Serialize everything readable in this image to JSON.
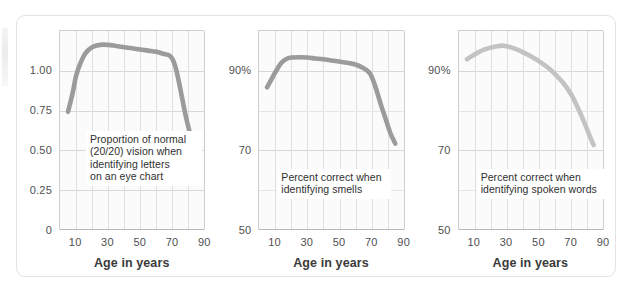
{
  "figure": {
    "axis_title": "Age in years",
    "curve_color_dark": "#9b9b9b",
    "curve_color_light": "#c3c3c3",
    "grid_color": "#e0e0e0",
    "panel_bg": "#fbfbfb",
    "card_border": "#e3e3e3"
  },
  "chart_data": [
    {
      "type": "line",
      "title": "",
      "annotation": "Proportion of normal\n(20/20) vision when\nidentifying letters\non an eye chart",
      "xlabel": "Age in years",
      "ylabel": "",
      "xlim": [
        0,
        90
      ],
      "ylim": [
        0,
        1.25
      ],
      "xticks": [
        10,
        30,
        50,
        70,
        90
      ],
      "xtick_labels": [
        "10",
        "30",
        "50",
        "70",
        "90"
      ],
      "yticks": [
        0,
        0.25,
        0.5,
        0.75,
        1.0
      ],
      "ytick_labels": [
        "0",
        "0.25",
        "0.50",
        "0.75",
        "1.00"
      ],
      "grid": true,
      "legend": "none",
      "series": [
        {
          "name": "Proportion of normal (20/20) vision",
          "color": "#9b9b9b",
          "x": [
            5,
            8,
            10,
            13,
            16,
            20,
            25,
            30,
            35,
            40,
            45,
            50,
            55,
            60,
            65,
            68,
            70,
            72,
            74,
            76,
            78,
            80,
            83,
            85
          ],
          "values": [
            0.55,
            0.72,
            0.86,
            0.98,
            1.06,
            1.11,
            1.13,
            1.13,
            1.12,
            1.11,
            1.1,
            1.09,
            1.08,
            1.07,
            1.05,
            1.04,
            1.01,
            0.94,
            0.82,
            0.68,
            0.54,
            0.42,
            0.25,
            0.14
          ]
        }
      ]
    },
    {
      "type": "line",
      "title": "",
      "annotation": "Percent correct when\nidentifying smells",
      "xlabel": "Age in years",
      "ylabel": "",
      "xlim": [
        0,
        90
      ],
      "ylim": [
        50,
        100
      ],
      "xticks": [
        10,
        30,
        50,
        70,
        90
      ],
      "xtick_labels": [
        "10",
        "30",
        "50",
        "70",
        "90"
      ],
      "yticks": [
        50,
        70,
        90
      ],
      "ytick_labels": [
        "50",
        "70",
        "90%"
      ],
      "grid": true,
      "legend": "none",
      "series": [
        {
          "name": "Percent correct identifying smells",
          "color": "#9b9b9b",
          "x": [
            5,
            8,
            11,
            14,
            17,
            20,
            25,
            30,
            35,
            40,
            45,
            50,
            55,
            60,
            65,
            68,
            70,
            73,
            76,
            79,
            82,
            85
          ],
          "values": [
            80.5,
            83.5,
            86.5,
            89.0,
            90.3,
            90.8,
            90.9,
            90.8,
            90.5,
            90.2,
            89.8,
            89.4,
            89.0,
            88.4,
            87.2,
            86.0,
            84.5,
            80.0,
            74.5,
            69.5,
            64.5,
            61.0
          ]
        }
      ]
    },
    {
      "type": "line",
      "title": "",
      "annotation": "Percent correct when\nidentifying spoken words",
      "xlabel": "Age in years",
      "ylabel": "",
      "xlim": [
        0,
        90
      ],
      "ylim": [
        50,
        100
      ],
      "xticks": [
        10,
        30,
        50,
        70,
        90
      ],
      "xtick_labels": [
        "10",
        "30",
        "50",
        "70",
        "90"
      ],
      "yticks": [
        50,
        70,
        90
      ],
      "ytick_labels": [
        "50",
        "70",
        "90%"
      ],
      "grid": true,
      "legend": "none",
      "series": [
        {
          "name": "Percent correct identifying spoken words",
          "color": "#c3c3c3",
          "x": [
            5,
            8,
            12,
            16,
            20,
            25,
            28,
            32,
            36,
            40,
            45,
            50,
            55,
            60,
            65,
            70,
            74,
            78,
            82,
            84
          ],
          "values": [
            90.2,
            91.3,
            92.6,
            93.6,
            94.3,
            94.8,
            94.9,
            94.4,
            93.6,
            92.6,
            91.2,
            89.5,
            87.5,
            85.0,
            82.0,
            78.0,
            73.5,
            68.5,
            63.0,
            60.5
          ]
        }
      ]
    }
  ]
}
